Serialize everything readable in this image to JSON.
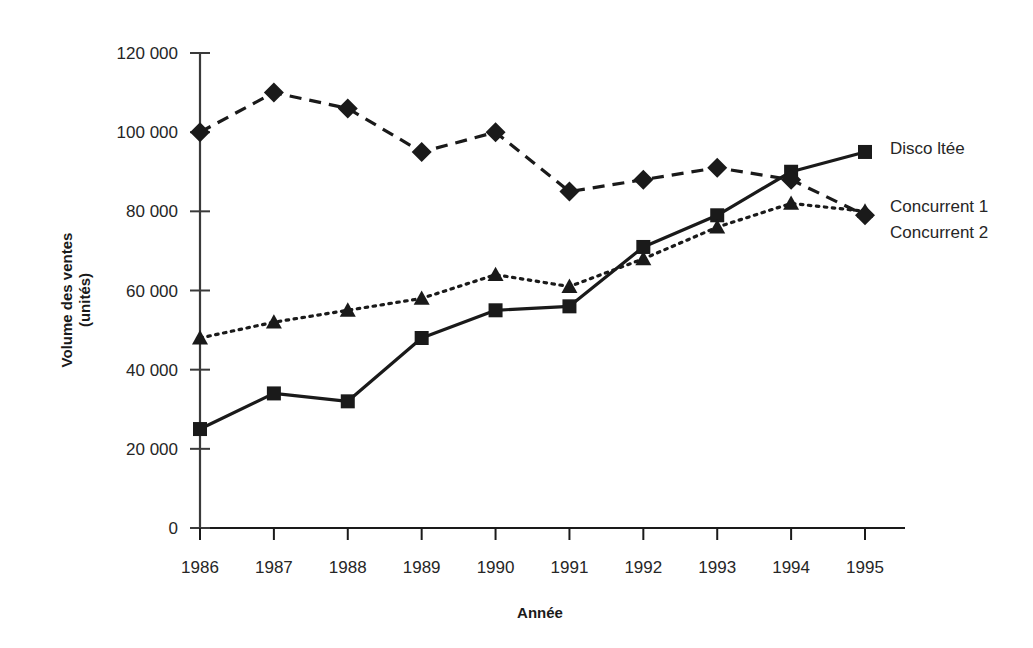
{
  "chart_data": {
    "type": "line",
    "title": "",
    "xlabel": "Année",
    "ylabel": "Volume des ventes (unités)",
    "ylabel_line1": "Volume des ventes",
    "ylabel_line2": "(unités)",
    "x": [
      "1986",
      "1987",
      "1988",
      "1989",
      "1990",
      "1991",
      "1992",
      "1993",
      "1994",
      "1995"
    ],
    "categories": [
      "1986",
      "1987",
      "1988",
      "1989",
      "1990",
      "1991",
      "1992",
      "1993",
      "1994",
      "1995"
    ],
    "xlim": [
      1986,
      1995
    ],
    "ylim": [
      0,
      120000
    ],
    "yticks": [
      0,
      20000,
      40000,
      60000,
      80000,
      100000,
      120000
    ],
    "ytick_labels": [
      "0",
      "20 000",
      "40 000",
      "60 000",
      "80 000",
      "100 000",
      "120 000"
    ],
    "grid": false,
    "legend_position": "right",
    "series": [
      {
        "name": "Disco ltée",
        "marker": "square",
        "line_style": "solid",
        "color": "#1a1a1a",
        "values": [
          25000,
          34000,
          32000,
          48000,
          55000,
          56000,
          71000,
          79000,
          90000,
          95000
        ]
      },
      {
        "name": "Concurrent 1",
        "marker": "triangle",
        "line_style": "dotted",
        "color": "#1a1a1a",
        "values": [
          48000,
          52000,
          55000,
          58000,
          64000,
          61000,
          68000,
          76000,
          82000,
          80000
        ]
      },
      {
        "name": "Concurrent 2",
        "marker": "diamond",
        "line_style": "dashed",
        "color": "#1a1a1a",
        "values": [
          100000,
          110000,
          106000,
          95000,
          100000,
          85000,
          88000,
          91000,
          88000,
          79000
        ]
      }
    ]
  },
  "legend": {
    "entries": [
      {
        "label": "Disco ltée",
        "marker": "square"
      },
      {
        "label": "Concurrent 1",
        "marker": "triangle"
      },
      {
        "label": "Concurrent 2",
        "marker": "diamond"
      }
    ]
  },
  "axes": {
    "y_title_line1": "Volume des ventes",
    "y_title_line2": "(unités)",
    "x_title": "Année"
  }
}
